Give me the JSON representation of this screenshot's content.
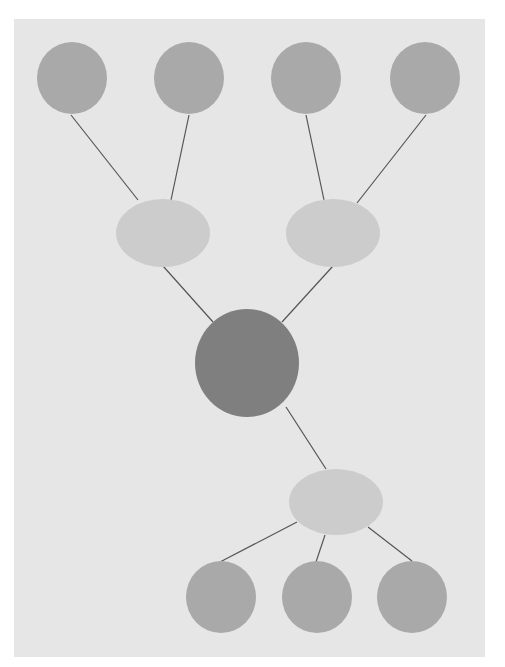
{
  "diagram": {
    "type": "tree",
    "background": "#e6e6e6",
    "edge_color": "#555555",
    "nodes": [
      {
        "id": "top1",
        "shape": "circle",
        "cx": 72,
        "cy": 78,
        "rx": 35,
        "ry": 36,
        "fill": "#a9a9a9"
      },
      {
        "id": "top2",
        "shape": "circle",
        "cx": 189,
        "cy": 78,
        "rx": 35,
        "ry": 36,
        "fill": "#a9a9a9"
      },
      {
        "id": "top3",
        "shape": "circle",
        "cx": 306,
        "cy": 78,
        "rx": 35,
        "ry": 36,
        "fill": "#a9a9a9"
      },
      {
        "id": "top4",
        "shape": "circle",
        "cx": 425,
        "cy": 78,
        "rx": 35,
        "ry": 36,
        "fill": "#a9a9a9"
      },
      {
        "id": "mid-left",
        "shape": "ellipse",
        "cx": 163,
        "cy": 233,
        "rx": 47,
        "ry": 34,
        "fill": "#cccccc"
      },
      {
        "id": "mid-right",
        "shape": "ellipse",
        "cx": 333,
        "cy": 233,
        "rx": 47,
        "ry": 34,
        "fill": "#cccccc"
      },
      {
        "id": "center",
        "shape": "circle",
        "cx": 247,
        "cy": 363,
        "rx": 52,
        "ry": 54,
        "fill": "#7f7f7f"
      },
      {
        "id": "lower",
        "shape": "ellipse",
        "cx": 336,
        "cy": 502,
        "rx": 47,
        "ry": 33,
        "fill": "#cccccc"
      },
      {
        "id": "bottom1",
        "shape": "circle",
        "cx": 221,
        "cy": 597,
        "rx": 35,
        "ry": 36,
        "fill": "#a9a9a9"
      },
      {
        "id": "bottom2",
        "shape": "circle",
        "cx": 317,
        "cy": 597,
        "rx": 35,
        "ry": 36,
        "fill": "#a9a9a9"
      },
      {
        "id": "bottom3",
        "shape": "circle",
        "cx": 412,
        "cy": 597,
        "rx": 35,
        "ry": 36,
        "fill": "#a9a9a9"
      }
    ],
    "edges": [
      {
        "x1": 71,
        "y1": 115,
        "x2": 138,
        "y2": 200
      },
      {
        "x1": 189,
        "y1": 115,
        "x2": 171,
        "y2": 200
      },
      {
        "x1": 306,
        "y1": 115,
        "x2": 324,
        "y2": 200
      },
      {
        "x1": 426,
        "y1": 115,
        "x2": 357,
        "y2": 203
      },
      {
        "x1": 163,
        "y1": 266,
        "x2": 213,
        "y2": 322
      },
      {
        "x1": 333,
        "y1": 266,
        "x2": 282,
        "y2": 322
      },
      {
        "x1": 286,
        "y1": 407,
        "x2": 326,
        "y2": 469
      },
      {
        "x1": 297,
        "y1": 522,
        "x2": 220,
        "y2": 562
      },
      {
        "x1": 325,
        "y1": 535,
        "x2": 316,
        "y2": 562
      },
      {
        "x1": 368,
        "y1": 527,
        "x2": 412,
        "y2": 561
      }
    ]
  }
}
